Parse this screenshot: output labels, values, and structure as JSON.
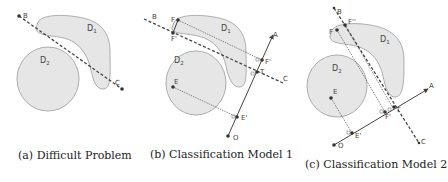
{
  "figure": {
    "panels": [
      {
        "id": "a",
        "caption": "(a) Difficult Problem",
        "regions": [
          {
            "name": "D",
            "subscript": "1"
          },
          {
            "name": "D",
            "subscript": "2"
          }
        ],
        "points": [
          "B",
          "C"
        ],
        "lines": [
          {
            "from": "B",
            "to": "C",
            "style": "dashed"
          }
        ]
      },
      {
        "id": "b",
        "caption": "(b) Classification Model 1",
        "regions": [
          {
            "name": "D",
            "subscript": "1"
          },
          {
            "name": "D",
            "subscript": "2"
          }
        ],
        "points": [
          "A",
          "B",
          "C",
          "E",
          "E'",
          "F",
          "F'",
          "T",
          "O"
        ],
        "labels": {
          "A": "A",
          "B": "B",
          "C": "C",
          "E": "E",
          "E_proj": "E'",
          "F": "F",
          "F_proj": "F'",
          "F_on_BC": "F'",
          "T": "T",
          "O": "O"
        },
        "lines": [
          {
            "from": "B",
            "to": "C",
            "style": "dashed"
          },
          {
            "from": "O",
            "to": "A",
            "style": "solid-arrow"
          },
          {
            "from": "E",
            "to": "E'",
            "style": "dotted"
          },
          {
            "from": "F",
            "to": "F'",
            "style": "dotted"
          }
        ]
      },
      {
        "id": "c",
        "caption": "(c) Classification Model 2",
        "regions": [
          {
            "name": "D",
            "subscript": "1"
          },
          {
            "name": "D",
            "subscript": "2"
          }
        ],
        "points": [
          "A",
          "B",
          "C",
          "E",
          "E'",
          "F",
          "F'",
          "F''",
          "T",
          "O"
        ],
        "labels": {
          "A": "A",
          "B": "B",
          "C": "C",
          "E": "E",
          "E_proj": "E'",
          "F": "F",
          "F_proj": "F'",
          "F_dd": "F''",
          "T": "T",
          "O": "O"
        },
        "lines": [
          {
            "from": "B",
            "to": "C",
            "style": "dashed"
          },
          {
            "from": "O",
            "to": "A",
            "style": "solid-arrow"
          },
          {
            "from": "E",
            "to": "E'",
            "style": "dotted"
          },
          {
            "from": "F",
            "to": "F'",
            "style": "dotted"
          }
        ]
      }
    ],
    "colors": {
      "region_fill": "#e6e6e6",
      "region_stroke": "#9a9a9a",
      "line": "#444444",
      "point": "#333333",
      "caption_text": "#222222"
    }
  }
}
